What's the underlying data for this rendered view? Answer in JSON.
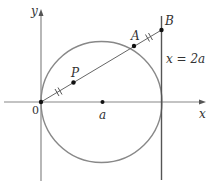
{
  "diagram": {
    "axes": {
      "x_label": "x",
      "y_label": "y",
      "origin_label": "0"
    },
    "points": {
      "P": "P",
      "A": "A",
      "B": "B",
      "a": "a"
    },
    "vertical_line_label": "x = 2a",
    "colors": {
      "axis": "#777777",
      "circle": "#777777",
      "line": "#555555",
      "point": "#111111",
      "text": "#333333"
    }
  }
}
